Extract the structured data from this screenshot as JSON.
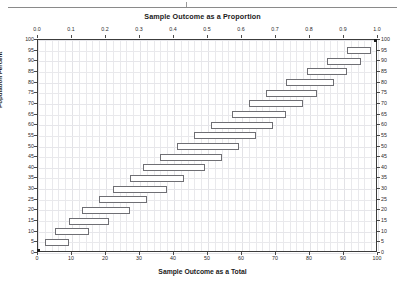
{
  "header": {
    "rule": true
  },
  "chart_data": {
    "type": "bar",
    "title": "Sample Outcome as a Proportion",
    "xlabel": "Sample Outcome as a Total",
    "ylabel": "Population Percent",
    "orientation": "horizontal",
    "grid": true,
    "legend": "none",
    "top_axis": {
      "label": "Sample Outcome as a Proportion",
      "ticks": [
        "0.0",
        "0.1",
        "0.2",
        "0.3",
        "0.4",
        "0.5",
        "0.6",
        "0.7",
        "0.8",
        "0.9",
        "1.0"
      ],
      "range": [
        0,
        1
      ]
    },
    "bottom_axis": {
      "label": "Sample Outcome as a Total",
      "ticks": [
        "0",
        "10",
        "20",
        "30",
        "40",
        "50",
        "60",
        "70",
        "80",
        "90",
        "100"
      ],
      "range": [
        0,
        100
      ]
    },
    "left_axis": {
      "label": "Population Percent",
      "ticks": [
        "0",
        "5",
        "10",
        "15",
        "20",
        "25",
        "30",
        "35",
        "40",
        "45",
        "50",
        "55",
        "60",
        "65",
        "70",
        "75",
        "80",
        "85",
        "90",
        "95",
        "100"
      ],
      "range": [
        0,
        100
      ]
    },
    "right_axis": {
      "ticks": [
        "0",
        "5",
        "10",
        "15",
        "20",
        "25",
        "30",
        "35",
        "40",
        "45",
        "50",
        "55",
        "60",
        "65",
        "70",
        "75",
        "80",
        "85",
        "90",
        "95",
        "100"
      ],
      "range": [
        0,
        100
      ]
    },
    "categories": [
      5,
      10,
      15,
      20,
      25,
      30,
      35,
      40,
      45,
      50,
      55,
      60,
      65,
      70,
      75,
      80,
      85,
      90,
      95
    ],
    "intervals": [
      {
        "population_percent": 5,
        "low": 2,
        "high": 9
      },
      {
        "population_percent": 10,
        "low": 5,
        "high": 15
      },
      {
        "population_percent": 15,
        "low": 9,
        "high": 21
      },
      {
        "population_percent": 20,
        "low": 13,
        "high": 27
      },
      {
        "population_percent": 25,
        "low": 18,
        "high": 32
      },
      {
        "population_percent": 30,
        "low": 22,
        "high": 38
      },
      {
        "population_percent": 35,
        "low": 27,
        "high": 43
      },
      {
        "population_percent": 40,
        "low": 31,
        "high": 49
      },
      {
        "population_percent": 45,
        "low": 36,
        "high": 54
      },
      {
        "population_percent": 50,
        "low": 41,
        "high": 59
      },
      {
        "population_percent": 55,
        "low": 46,
        "high": 64
      },
      {
        "population_percent": 60,
        "low": 51,
        "high": 69
      },
      {
        "population_percent": 65,
        "low": 57,
        "high": 73
      },
      {
        "population_percent": 70,
        "low": 62,
        "high": 78
      },
      {
        "population_percent": 75,
        "low": 67,
        "high": 82
      },
      {
        "population_percent": 80,
        "low": 73,
        "high": 87
      },
      {
        "population_percent": 85,
        "low": 79,
        "high": 91
      },
      {
        "population_percent": 90,
        "low": 85,
        "high": 95
      },
      {
        "population_percent": 95,
        "low": 91,
        "high": 98
      }
    ]
  }
}
